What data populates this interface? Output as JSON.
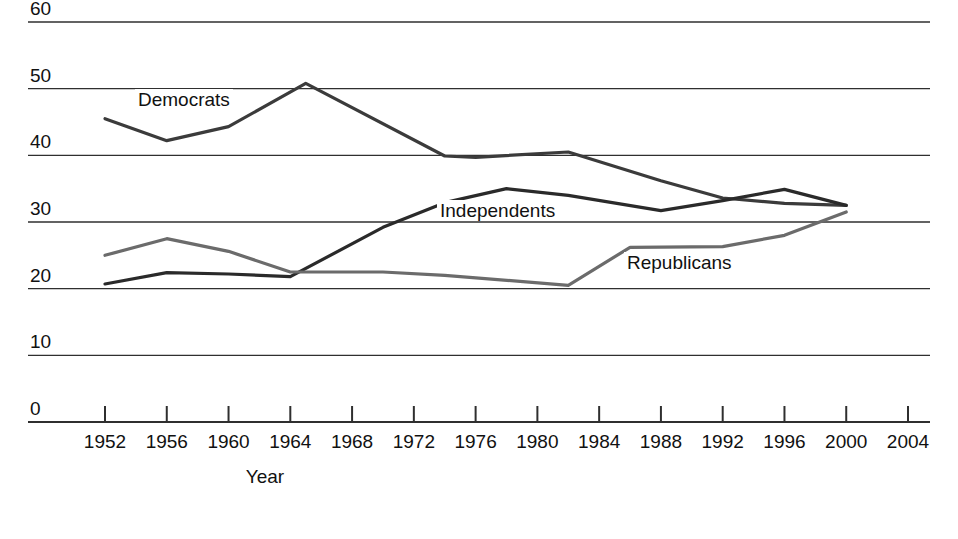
{
  "chart_data": {
    "type": "line",
    "title": "",
    "subtitle": "",
    "xlabel": "Year",
    "ylabel": "",
    "grid": true,
    "legend_position": "inline-labels",
    "xlim": [
      1950,
      2004
    ],
    "ylim": [
      0,
      60
    ],
    "xticks": [
      "1952",
      "1956",
      "1960",
      "1964",
      "1968",
      "1972",
      "1976",
      "1980",
      "1984",
      "1988",
      "1992",
      "1996",
      "2000",
      "2004"
    ],
    "yticks": [
      "0",
      "10",
      "20",
      "30",
      "40",
      "50",
      "60"
    ],
    "series": [
      {
        "name": "Democrats",
        "color": "#3b3b3b",
        "x": [
          1952,
          1956,
          1960,
          1965,
          1974,
          1976,
          1982,
          1988,
          1992,
          1996,
          2000
        ],
        "values": [
          45.5,
          42.2,
          44.3,
          50.8,
          39.9,
          39.7,
          40.5,
          36.2,
          33.6,
          32.8,
          32.5
        ]
      },
      {
        "name": "Independents",
        "color": "#2a2a2a",
        "x": [
          1952,
          1956,
          1960,
          1964,
          1970,
          1974,
          1978,
          1982,
          1988,
          1992,
          1996,
          2000
        ],
        "values": [
          20.7,
          22.4,
          22.2,
          21.8,
          29.2,
          32.9,
          35.0,
          34.0,
          31.7,
          33.2,
          34.9,
          32.5
        ]
      },
      {
        "name": "Republicans",
        "color": "#6b6b6b",
        "x": [
          1952,
          1956,
          1960,
          1964,
          1970,
          1974,
          1982,
          1986,
          1992,
          1996,
          2000
        ],
        "values": [
          25.0,
          27.5,
          25.6,
          22.5,
          22.5,
          22.0,
          20.5,
          26.2,
          26.3,
          28.0,
          31.5
        ]
      }
    ],
    "annotations": [
      {
        "text": "Democrats",
        "x_px": 135,
        "y_px": 89
      },
      {
        "text": "Independents",
        "x_px": 437,
        "y_px": 200
      },
      {
        "text": "Republicans",
        "x_px": 624,
        "y_px": 252
      }
    ]
  }
}
